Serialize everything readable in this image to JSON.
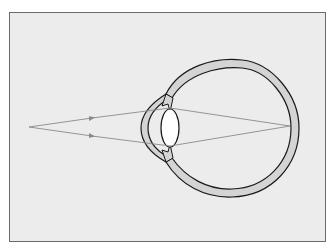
{
  "diagram": {
    "colors": {
      "background": "#ececec",
      "frame_border": "#6a6a6a",
      "sclera_fill": "#d4d4d4",
      "outline": "#1a1a1a",
      "ray": "#8a8a8a",
      "lens_fill": "#ffffff"
    },
    "elements": {
      "object_point": {
        "x": 29,
        "y": 127
      },
      "focal_point": {
        "x": 290,
        "y": 126
      },
      "rays": [
        {
          "name": "upper-ray",
          "from": [
            29,
            127
          ],
          "refract_at": [
            165,
            110
          ],
          "to": [
            290,
            126
          ],
          "arrow_at": [
            92,
            118
          ]
        },
        {
          "name": "lower-ray",
          "from": [
            29,
            127
          ],
          "refract_at": [
            165,
            146
          ],
          "to": [
            290,
            126
          ],
          "arrow_at": [
            92,
            136
          ]
        }
      ]
    }
  }
}
